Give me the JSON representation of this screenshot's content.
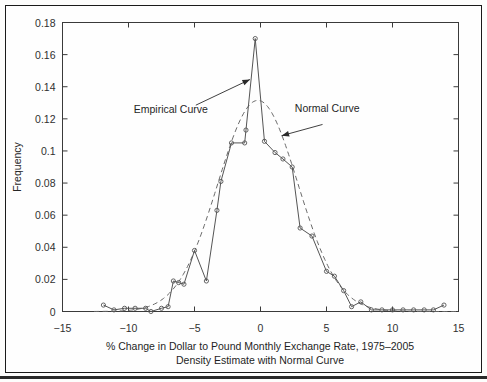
{
  "figure": {
    "background_color": "#fefefe",
    "frame_color": "#1a1a1a"
  },
  "chart_data": {
    "type": "line",
    "title": "",
    "xlabel": "% Change in Dollar to Pound Monthly Exchange Rate, 1975–2005",
    "xlabel_line2": "Density Estimate with Normal Curve",
    "ylabel": "Frequency",
    "xlim": [
      -15,
      15
    ],
    "ylim": [
      0,
      0.18
    ],
    "xticks": [
      -15,
      -10,
      -5,
      0,
      5,
      10,
      15
    ],
    "xtick_labels": [
      "−15",
      "−10",
      "−5",
      "0",
      "5",
      "10",
      "15"
    ],
    "yticks": [
      0,
      0.02,
      0.04,
      0.06,
      0.08,
      0.1,
      0.12,
      0.14,
      0.16,
      0.18
    ],
    "ytick_labels": [
      "0",
      "0.02",
      "0.04",
      "0.06",
      "0.08",
      "0.1",
      "0.12",
      "0.14",
      "0.16",
      "0.18"
    ],
    "grid": false,
    "legend_position": "none",
    "series": [
      {
        "name": "Empirical Curve",
        "style": "solid-with-open-circle-markers",
        "color": "#555555",
        "points": [
          [
            -11.9,
            0.004
          ],
          [
            -11.1,
            0.001
          ],
          [
            -10.3,
            0.002
          ],
          [
            -9.5,
            0.002
          ],
          [
            -8.7,
            0.002
          ],
          [
            -8.3,
            0.0
          ],
          [
            -7.5,
            0.002
          ],
          [
            -7.0,
            0.003
          ],
          [
            -6.6,
            0.019
          ],
          [
            -6.2,
            0.018
          ],
          [
            -5.8,
            0.017
          ],
          [
            -5.0,
            0.038
          ],
          [
            -4.1,
            0.019
          ],
          [
            -3.3,
            0.063
          ],
          [
            -3.0,
            0.081
          ],
          [
            -2.2,
            0.105
          ],
          [
            -1.2,
            0.105
          ],
          [
            -1.1,
            0.113
          ],
          [
            -0.4,
            0.17
          ],
          [
            0.3,
            0.106
          ],
          [
            1.1,
            0.099
          ],
          [
            1.7,
            0.095
          ],
          [
            2.4,
            0.09
          ],
          [
            3.0,
            0.052
          ],
          [
            3.9,
            0.047
          ],
          [
            5.0,
            0.025
          ],
          [
            5.6,
            0.022
          ],
          [
            6.3,
            0.013
          ],
          [
            6.9,
            0.003
          ],
          [
            7.6,
            0.006
          ],
          [
            8.4,
            0.001
          ],
          [
            9.2,
            0.001
          ],
          [
            10.0,
            0.001
          ],
          [
            10.8,
            0.001
          ],
          [
            11.6,
            0.001
          ],
          [
            12.4,
            0.001
          ],
          [
            13.1,
            0.001
          ],
          [
            13.9,
            0.004
          ]
        ]
      },
      {
        "name": "Normal Curve",
        "style": "dashed",
        "color": "#6a6a6a",
        "mean": -0.2,
        "sigma": 3.03,
        "peak": 0.1315
      }
    ],
    "annotations": [
      {
        "label": "Empirical Curve",
        "text_x": -9.6,
        "text_y": 0.1235,
        "arrow_from_x": -4.9,
        "arrow_from_y": 0.1285,
        "arrow_to_x": -0.8,
        "arrow_to_y": 0.1445
      },
      {
        "label": "Normal Curve",
        "text_x": 2.6,
        "text_y": 0.1245,
        "arrow_from_x": 4.7,
        "arrow_from_y": 0.1165,
        "arrow_to_x": 1.6,
        "arrow_to_y": 0.1095
      }
    ]
  }
}
